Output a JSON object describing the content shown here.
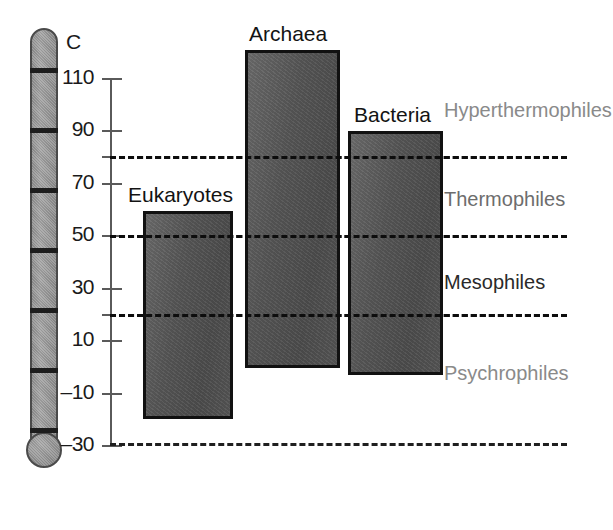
{
  "figure": {
    "unit_label": "C",
    "background_color": "#ffffff"
  },
  "axis": {
    "ticks": [
      {
        "value": 110,
        "label": "110",
        "y": 78,
        "major": true
      },
      {
        "value": 90,
        "label": "90",
        "y": 130,
        "major": true
      },
      {
        "value": 80,
        "label": "",
        "y": 156,
        "major": false
      },
      {
        "value": 70,
        "label": "70",
        "y": 183,
        "major": true
      },
      {
        "value": 50,
        "label": "50",
        "y": 235,
        "major": true
      },
      {
        "value": 30,
        "label": "30",
        "y": 288,
        "major": true
      },
      {
        "value": 20,
        "label": "",
        "y": 314,
        "major": false
      },
      {
        "value": 10,
        "label": "10",
        "y": 340,
        "major": true
      },
      {
        "value": -10,
        "label": "–10",
        "y": 393,
        "major": true
      },
      {
        "value": -30,
        "label": "–30",
        "y": 445,
        "major": true
      }
    ],
    "min": -30,
    "max": 110,
    "unit": "C"
  },
  "thermometer": {
    "name": "celsius-thermometer",
    "segment_marks_y": [
      68,
      128,
      188,
      248,
      308,
      368,
      428
    ],
    "stem_color": "#8d8d8d",
    "outline_color": "#4a4a4a"
  },
  "boundaries": [
    {
      "name": "hyperthermophile-thermophile-boundary",
      "value": 80,
      "y": 156
    },
    {
      "name": "thermophile-mesophile-boundary",
      "value": 50,
      "y": 235
    },
    {
      "name": "mesophile-psychrophile-boundary",
      "value": 20,
      "y": 314
    },
    {
      "name": "lower-limit-boundary",
      "value": -30,
      "y": 443
    }
  ],
  "class_labels": [
    {
      "name": "hyperthermophiles",
      "text": "Hyperthermophiles",
      "x": 444,
      "y": 99,
      "color": "#8a8a8a"
    },
    {
      "name": "thermophiles",
      "text": "Thermophiles",
      "x": 444,
      "y": 188,
      "color": "#6d6d6d"
    },
    {
      "name": "mesophiles",
      "text": "Mesophiles",
      "x": 444,
      "y": 271,
      "color": "#2a2a2a"
    },
    {
      "name": "psychrophiles",
      "text": "Psychrophiles",
      "x": 444,
      "y": 362,
      "color": "#8a8a8a"
    }
  ],
  "chart_data": {
    "type": "bar",
    "title": "",
    "xlabel": "",
    "ylabel": "C",
    "ylim": [
      -30,
      110
    ],
    "grid": false,
    "legend": "none",
    "orientation": "vertical-range",
    "categories": [
      "Eukaryotes",
      "Archaea",
      "Bacteria"
    ],
    "series": [
      {
        "name": "temperature range",
        "ranges": [
          [
            -20,
            59
          ],
          [
            0,
            121
          ],
          [
            -3,
            90
          ]
        ]
      }
    ],
    "bars": [
      {
        "name": "eukaryotes-bar",
        "label": "Eukaryotes",
        "min": -20,
        "max": 59,
        "x": 143,
        "width": 90,
        "top_y": 211,
        "bottom_y": 419,
        "label_x": 128,
        "label_y": 183
      },
      {
        "name": "archaea-bar",
        "label": "Archaea",
        "min": 0,
        "max": 121,
        "x": 245,
        "width": 95,
        "top_y": 50,
        "bottom_y": 368,
        "label_x": 249,
        "label_y": 22
      },
      {
        "name": "bacteria-bar",
        "label": "Bacteria",
        "min": -3,
        "max": 90,
        "x": 348,
        "width": 95,
        "top_y": 131,
        "bottom_y": 375,
        "label_x": 354,
        "label_y": 103
      }
    ],
    "annotations": [
      {
        "text": "Hyperthermophiles",
        "above_value": 80
      },
      {
        "text": "Thermophiles",
        "range": [
          50,
          80
        ]
      },
      {
        "text": "Mesophiles",
        "range": [
          20,
          50
        ]
      },
      {
        "text": "Psychrophiles",
        "below_value": 20
      }
    ]
  }
}
